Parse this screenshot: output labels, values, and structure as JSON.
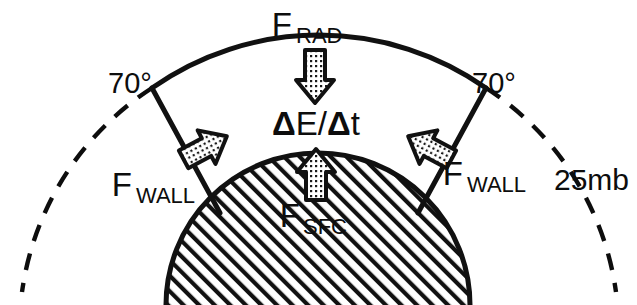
{
  "figure": {
    "background_color": "#ffffff",
    "ink_color": "#0d0d0d"
  },
  "labels": {
    "radiative_flux": {
      "symbol": "F",
      "subscript": "RAD"
    },
    "wall_flux_left": {
      "symbol": "F",
      "subscript": "WALL"
    },
    "wall_flux_right": {
      "symbol": "F",
      "subscript": "WALL"
    },
    "surface_flux": {
      "symbol": "F",
      "subscript": "SFC"
    },
    "energy_tendency": {
      "text": "ΔE/Δt",
      "d1": "Δ",
      "e": "E",
      "slash": "/",
      "d2": "Δ",
      "t": "t"
    },
    "latitude_left": "70°",
    "latitude_right": "70°",
    "pressure_level": "25mb"
  },
  "arrows": {
    "radiative": {
      "name": "arrow-down-radiative",
      "direction": "down",
      "fill": "stippled"
    },
    "wall_left": {
      "name": "arrow-wall-left",
      "direction": "up-right",
      "fill": "stippled"
    },
    "wall_right": {
      "name": "arrow-wall-right",
      "direction": "up-left",
      "fill": "stippled"
    },
    "surface": {
      "name": "arrow-up-surface",
      "direction": "up",
      "fill": "stippled"
    }
  },
  "geometry": {
    "solid_arc_label": "25mb isobaric lid",
    "dashed_arc_label": "25mb surface extension",
    "dome_label": "hatched polar cap surface",
    "wall_left_label": "left control volume wall",
    "wall_right_label": "right control volume wall"
  }
}
